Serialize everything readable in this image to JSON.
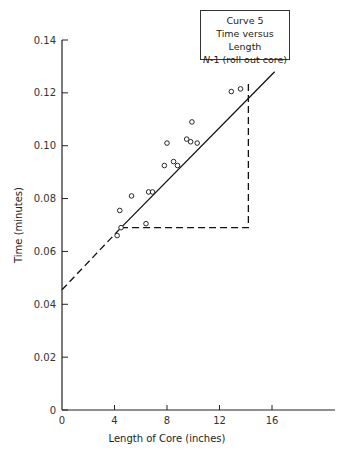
{
  "chart_data": {
    "type": "scatter",
    "title": "Curve 5",
    "subtitle": "Time versus Length",
    "annotation": "N-1 (roll out core)",
    "xlabel": "Length of Core (inches)",
    "ylabel": "Time (minutes)",
    "xlim": [
      0,
      20
    ],
    "ylim": [
      0,
      0.14
    ],
    "x_ticks": [
      0,
      4,
      8,
      12,
      16
    ],
    "y_ticks": [
      0,
      0.02,
      0.04,
      0.06,
      0.08,
      0.1,
      0.12,
      0.14
    ],
    "x_tick_labels": [
      "0",
      "4",
      "8",
      "12",
      "16"
    ],
    "y_tick_labels": [
      "0",
      "0.02",
      "0.04",
      "0.06",
      "0.08",
      "0.10",
      "0.12",
      "0.14"
    ],
    "grid": false,
    "legend_position": "top-right",
    "series": [
      {
        "name": "Observed",
        "marker": "open-circle",
        "points": [
          [
            4.2,
            0.066
          ],
          [
            4.4,
            0.0755
          ],
          [
            4.5,
            0.069
          ],
          [
            5.3,
            0.081
          ],
          [
            6.4,
            0.0705
          ],
          [
            6.6,
            0.0825
          ],
          [
            6.9,
            0.0825
          ],
          [
            7.8,
            0.0925
          ],
          [
            8.0,
            0.101
          ],
          [
            8.5,
            0.094
          ],
          [
            8.8,
            0.0925
          ],
          [
            9.5,
            0.1025
          ],
          [
            9.8,
            0.1015
          ],
          [
            9.9,
            0.109
          ],
          [
            10.3,
            0.101
          ],
          [
            12.9,
            0.1205
          ],
          [
            13.6,
            0.1215
          ]
        ]
      },
      {
        "name": "Fitted line",
        "style": "solid",
        "points": [
          [
            4.5,
            0.069
          ],
          [
            16.2,
            0.128
          ]
        ]
      },
      {
        "name": "Fitted line extrapolation",
        "style": "dashed",
        "points": [
          [
            0,
            0.0455
          ],
          [
            4.5,
            0.069
          ]
        ]
      },
      {
        "name": "Slope triangle",
        "style": "dashed",
        "points": [
          [
            4.5,
            0.069
          ],
          [
            14.2,
            0.069
          ],
          [
            14.2,
            0.1245
          ]
        ]
      }
    ]
  },
  "legend": {
    "line1": "Curve 5",
    "line2": "Time versus Length",
    "line3_prefix": "N",
    "line3_rest": "-1 (roll out core)"
  }
}
